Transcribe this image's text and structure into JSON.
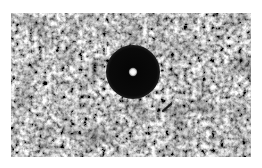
{
  "image": {
    "kind": "grayscale micrograph",
    "subject": "dark circular disc with bright central spot on granular speckled background",
    "colors": {
      "page_background": "#ffffff",
      "texture_light": "#e6e6e6",
      "texture_dark": "#3a3a3a",
      "disc": "#0a0a0a",
      "center_spot": "#f2f2f2"
    },
    "disc": {
      "center_x": 122,
      "center_y": 59,
      "radius": 27
    },
    "center_spot": {
      "radius": 4
    },
    "streak": {
      "x1": 152,
      "y1": 98,
      "x2": 160,
      "y2": 91
    }
  }
}
